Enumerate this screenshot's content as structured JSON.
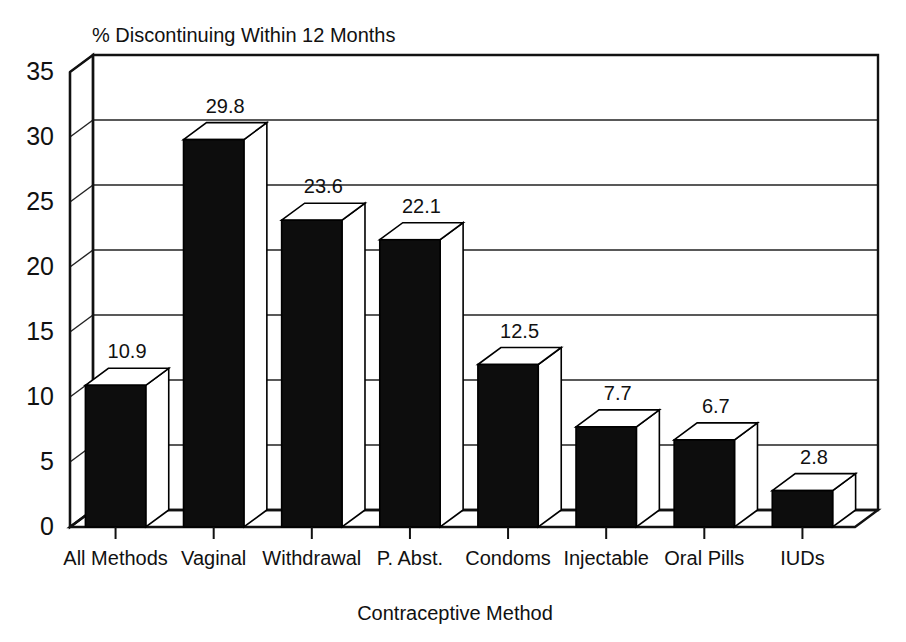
{
  "chart_data": {
    "type": "bar",
    "title": "% Discontinuing Within 12 Months",
    "subtitle": "",
    "xlabel": "Contraceptive Method",
    "ylabel": "",
    "categories": [
      "All Methods",
      "Vaginal",
      "Withdrawal",
      "P. Abst.",
      "Condoms",
      "Injectable",
      "Oral Pills",
      "IUDs"
    ],
    "values": [
      10.9,
      29.8,
      23.6,
      22.1,
      12.5,
      7.7,
      6.7,
      2.8
    ],
    "value_labels": [
      "10.9",
      "29.8",
      "23.6",
      "22.1",
      "12.5",
      "7.7",
      "6.7",
      "2.8"
    ],
    "ylim": [
      0,
      35
    ],
    "ytick_values": [
      0,
      5,
      10,
      15,
      20,
      25,
      30,
      35
    ],
    "ytick_labels": [
      "0",
      "5",
      "10",
      "15",
      "20",
      "25",
      "30",
      "35"
    ],
    "grid": true,
    "legend": "none",
    "style": "3d-column",
    "colors": {
      "bar_front": "#0d0d0d",
      "bar_top": "#ffffff",
      "bar_side": "#ffffff",
      "outline": "#000000",
      "gridline": "#222222",
      "background": "#ffffff",
      "text": "#111111"
    }
  },
  "labels": {
    "title": "% Discontinuing Within 12 Months",
    "x_axis_title": "Contraceptive Method"
  }
}
